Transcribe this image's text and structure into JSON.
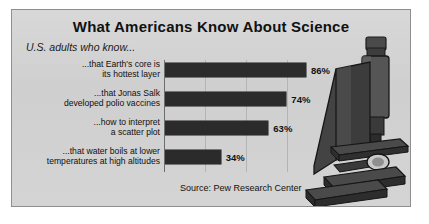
{
  "chart_data": {
    "type": "bar",
    "orientation": "horizontal",
    "title": "What Americans Know About Science",
    "subtitle": "U.S. adults who know...",
    "source": "Source: Pew Research Center",
    "xlabel": "",
    "ylabel": "",
    "xlim": [
      0,
      100
    ],
    "grid": true,
    "gridlines": [
      25,
      50,
      75
    ],
    "legend": "none",
    "value_suffix": "%",
    "bar_color": "#2b2b2b",
    "background_color": "#d2d2d2",
    "categories": [
      "...that Earth's core is\nits hottest layer",
      "...that Jonas Salk\ndeveloped polio vaccines",
      "...how to interpret\na scatter plot",
      "...that water boils at lower\ntemperatures at high altitudes"
    ],
    "values": [
      86,
      74,
      63,
      34
    ],
    "value_labels": [
      "86%",
      "74%",
      "63%",
      "34%"
    ]
  },
  "graphic": {
    "name": "microscope-illustration"
  }
}
